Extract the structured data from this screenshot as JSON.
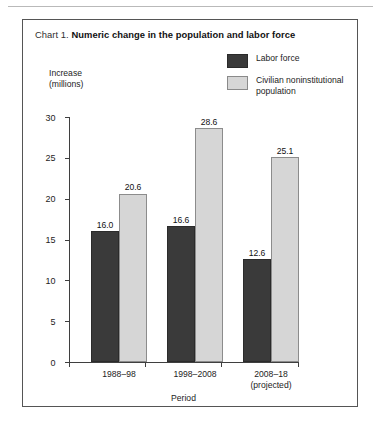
{
  "figure": {
    "label_prefix": "Chart 1.",
    "title": "Numeric change in the population and labor force"
  },
  "legend": {
    "position": "top-right",
    "entries": [
      {
        "label": "Labor force",
        "color": "#3a3a3a",
        "swatch": "dark-swatch"
      },
      {
        "label": "Civilian noninstitutional population",
        "color": "#d6d6d6",
        "swatch": "light-swatch"
      }
    ]
  },
  "axes": {
    "y_caption_line1": "Increase",
    "y_caption_line2": "(millions)",
    "x_title": "Period",
    "y_ticks": [
      "30",
      "25",
      "20",
      "15",
      "10",
      "5",
      "0"
    ]
  },
  "chart_data": {
    "type": "bar",
    "title": "Numeric change in the population and labor force",
    "xlabel": "Period",
    "ylabel": "Increase (millions)",
    "ylim": [
      0,
      30
    ],
    "ytick_step": 5,
    "grid": false,
    "legend_position": "top-right",
    "categories": [
      "1988–98",
      "1998–2008",
      "2008–18\n(projected)"
    ],
    "category_lines": [
      [
        "1988–98"
      ],
      [
        "1998–2008"
      ],
      [
        "2008–18",
        "(projected)"
      ]
    ],
    "series": [
      {
        "name": "Labor force",
        "color": "#3a3a3a",
        "values": [
          16.0,
          16.6,
          12.6
        ],
        "labels": [
          "16.0",
          "16.6",
          "12.6"
        ]
      },
      {
        "name": "Civilian noninstitutional population",
        "color": "#d6d6d6",
        "values": [
          20.6,
          28.6,
          25.1
        ],
        "labels": [
          "20.6",
          "28.6",
          "25.1"
        ]
      }
    ]
  }
}
